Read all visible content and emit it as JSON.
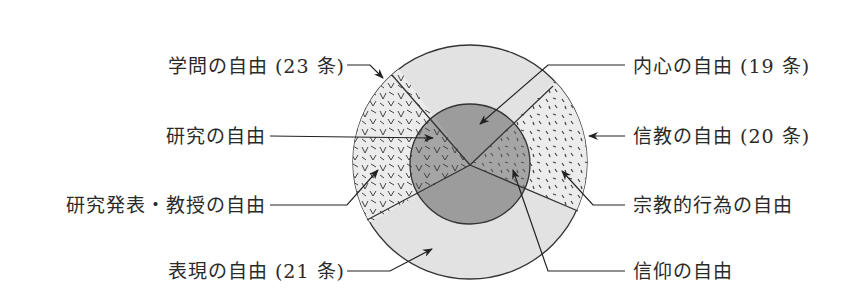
{
  "diagram": {
    "type": "concentric-circle-diagram",
    "colors": {
      "outline": "#333333",
      "outer_ring": "#e2e2e2",
      "inner_circle": "#9a9a9a",
      "hatch": "#444444",
      "text": "#2a2a2a"
    },
    "labels": {
      "academic_freedom": "学問の自由 (23 条)",
      "research_freedom": "研究の自由",
      "research_publication_teaching_freedom": "研究発表・教授の自由",
      "expression_freedom": "表現の自由 (21 条)",
      "inner_freedom": "内心の自由 (19 条)",
      "religious_freedom": "信教の自由 (20 条)",
      "religious_act_freedom": "宗教的行為の自由",
      "faith_freedom": "信仰の自由"
    }
  }
}
